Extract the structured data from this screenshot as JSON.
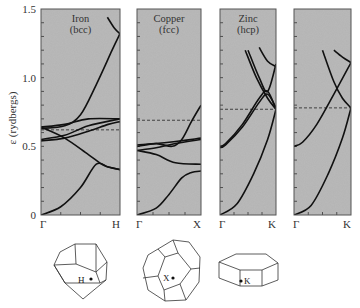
{
  "figure": {
    "y_axis_label": "ε (rydbergs)",
    "y_ticks": [
      "0",
      "0.5",
      "1.0",
      "1.5"
    ],
    "panels": [
      {
        "title": "Iron",
        "subtitle": "(bcc)",
        "k_start": "Γ",
        "k_end": "H"
      },
      {
        "title": "Copper",
        "subtitle": "(fcc)",
        "k_start": "Γ",
        "k_end": "X"
      },
      {
        "title": "Zinc",
        "subtitle": "(hcp)",
        "k_start": "Γ",
        "k_end": "K"
      },
      {
        "title": "",
        "subtitle": "",
        "k_start": "Γ",
        "k_end": "K"
      }
    ],
    "brillouin_zones": [
      {
        "shape": "rhombic dodecahedron",
        "point": "H"
      },
      {
        "shape": "truncated octahedron",
        "point": "X"
      },
      {
        "shape": "hexagonal prism",
        "point": "K"
      }
    ],
    "colors": {
      "panel_bg": "#b4b4b4",
      "line": "#111111",
      "frame": "#555555"
    }
  },
  "chart_data": [
    {
      "type": "line",
      "title": "Iron (bcc)",
      "xlabel": "",
      "ylabel": "ε (rydbergs)",
      "x_ticks": [
        "Γ",
        "H"
      ],
      "ylim": [
        0,
        1.5
      ],
      "fermi_level": 0.62,
      "series": [
        {
          "name": "band 1",
          "x": [
            0,
            0.25,
            0.5,
            0.7,
            0.85,
            1.0
          ],
          "values": [
            0.0,
            0.06,
            0.2,
            0.37,
            0.35,
            0.33
          ]
        },
        {
          "name": "band 2",
          "x": [
            0,
            0.3,
            0.6,
            0.8,
            1.0
          ],
          "values": [
            0.64,
            0.56,
            0.44,
            0.36,
            0.33
          ]
        },
        {
          "name": "band 3",
          "x": [
            0,
            0.3,
            0.6,
            1.0
          ],
          "values": [
            0.55,
            0.58,
            0.65,
            0.7
          ]
        },
        {
          "name": "band 4",
          "x": [
            0,
            0.3,
            0.6,
            0.85,
            1.0
          ],
          "values": [
            0.54,
            0.56,
            0.61,
            0.66,
            0.68
          ]
        },
        {
          "name": "band 5",
          "x": [
            0,
            0.3,
            0.6,
            1.0
          ],
          "values": [
            0.64,
            0.66,
            0.7,
            0.7
          ]
        },
        {
          "name": "band 6",
          "x": [
            0,
            0.3,
            0.5,
            0.7,
            0.9,
            1.0
          ],
          "values": [
            0.63,
            0.65,
            0.73,
            0.95,
            1.2,
            1.32
          ]
        },
        {
          "name": "band 7",
          "x": [
            0.84,
            0.93,
            1.0
          ],
          "values": [
            1.44,
            1.36,
            1.32
          ]
        }
      ]
    },
    {
      "type": "line",
      "title": "Copper (fcc)",
      "xlabel": "",
      "ylabel": "ε (rydbergs)",
      "x_ticks": [
        "Γ",
        "X"
      ],
      "ylim": [
        0,
        1.5
      ],
      "fermi_level": 0.69,
      "series": [
        {
          "name": "band 1",
          "x": [
            0,
            0.3,
            0.5,
            0.7,
            0.85,
            1.0
          ],
          "values": [
            0.0,
            0.05,
            0.15,
            0.27,
            0.31,
            0.32
          ]
        },
        {
          "name": "band 2",
          "x": [
            0,
            0.3,
            0.6,
            1.0
          ],
          "values": [
            0.47,
            0.44,
            0.38,
            0.37
          ]
        },
        {
          "name": "band 3",
          "x": [
            0,
            0.3,
            0.6,
            1.0
          ],
          "values": [
            0.47,
            0.49,
            0.52,
            0.55
          ]
        },
        {
          "name": "band 4",
          "x": [
            0,
            0.3,
            0.55,
            0.7,
            0.85,
            1.0
          ],
          "values": [
            0.5,
            0.52,
            0.5,
            0.55,
            0.68,
            0.8
          ]
        },
        {
          "name": "band 5",
          "x": [
            0,
            0.5,
            1.0
          ],
          "values": [
            0.51,
            0.53,
            0.56
          ]
        }
      ]
    },
    {
      "type": "line",
      "title": "Zinc (hcp)",
      "xlabel": "",
      "ylabel": "ε (rydbergs)",
      "x_ticks": [
        "Γ",
        "K"
      ],
      "ylim": [
        0,
        1.5
      ],
      "fermi_level": 0.77,
      "series": [
        {
          "name": "band 1",
          "x": [
            0,
            0.3,
            0.6,
            0.85,
            1.0
          ],
          "values": [
            0.0,
            0.08,
            0.3,
            0.55,
            0.77
          ]
        },
        {
          "name": "band 2",
          "x": [
            0,
            0.1,
            0.4,
            0.7,
            0.85,
            1.0
          ],
          "values": [
            0.5,
            0.52,
            0.66,
            0.85,
            0.9,
            0.77
          ]
        },
        {
          "name": "band 3",
          "x": [
            0,
            0.1,
            0.4,
            0.7,
            0.85,
            1.0
          ],
          "values": [
            0.49,
            0.51,
            0.64,
            0.82,
            0.88,
            0.78
          ]
        },
        {
          "name": "band 4",
          "x": [
            0.45,
            0.65,
            0.85,
            1.0
          ],
          "values": [
            1.2,
            1.0,
            0.85,
            0.77
          ]
        },
        {
          "name": "band 5",
          "x": [
            0.5,
            0.7,
            0.85,
            1.0
          ],
          "values": [
            1.2,
            1.0,
            0.9,
            1.1
          ]
        },
        {
          "name": "band 6",
          "x": [
            0.7,
            0.85,
            1.0
          ],
          "values": [
            1.22,
            1.12,
            1.08
          ]
        }
      ]
    },
    {
      "type": "line",
      "title": "",
      "xlabel": "",
      "ylabel": "ε (rydbergs)",
      "x_ticks": [
        "Γ",
        "K"
      ],
      "ylim": [
        0,
        1.5
      ],
      "fermi_level": 0.78,
      "series": [
        {
          "name": "band 1",
          "x": [
            0,
            0.3,
            0.6,
            0.85,
            1.0
          ],
          "values": [
            0.0,
            0.07,
            0.3,
            0.56,
            0.78
          ]
        },
        {
          "name": "band 2",
          "x": [
            0,
            0.15,
            0.4,
            0.7,
            1.0
          ],
          "values": [
            0.5,
            0.53,
            0.66,
            0.88,
            1.11
          ]
        },
        {
          "name": "band 3",
          "x": [
            0.5,
            0.7,
            0.85,
            1.0
          ],
          "values": [
            1.2,
            0.97,
            0.85,
            0.78
          ]
        },
        {
          "name": "band 4",
          "x": [
            0.7,
            0.85,
            1.0
          ],
          "values": [
            1.2,
            1.15,
            1.11
          ]
        }
      ]
    }
  ]
}
